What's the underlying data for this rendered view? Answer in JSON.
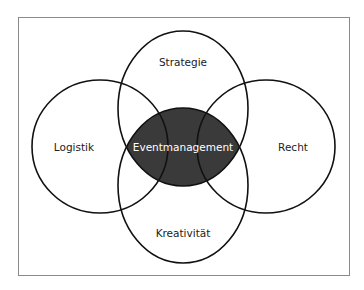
{
  "diagram": {
    "type": "venn",
    "center": {
      "label": "Eventmanagement",
      "fill": "#3a3a3a",
      "text_color": "#ffffff"
    },
    "sets": [
      {
        "id": "top",
        "label": "Strategie"
      },
      {
        "id": "left",
        "label": "Logistik"
      },
      {
        "id": "right",
        "label": "Recht"
      },
      {
        "id": "bottom",
        "label": "Kreativität"
      }
    ],
    "colors": {
      "stroke": "#111111",
      "frame": "#888888",
      "background": "#ffffff"
    }
  }
}
